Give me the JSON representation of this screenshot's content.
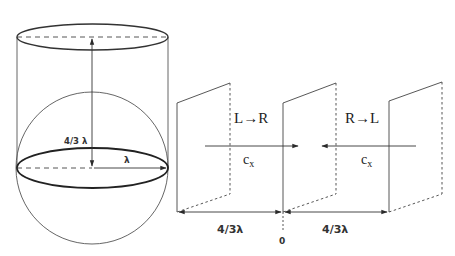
{
  "colors": {
    "stroke": "#3a3a3a",
    "background": "#ffffff"
  },
  "left_figure": {
    "description": "cylinder enclosing a sphere",
    "height_label": "4/3 λ",
    "radius_label": "λ"
  },
  "right_figure": {
    "description": "three parallel plates with opposing flux arrows",
    "left_flux_label": "L→R",
    "right_flux_label": "R→L",
    "velocity_label_left": "c",
    "velocity_label_left_sub": "x",
    "velocity_label_right": "c",
    "velocity_label_right_sub": "x",
    "spacing_left_label": "4/3λ",
    "spacing_right_label": "4/3λ",
    "origin_label": "0"
  }
}
